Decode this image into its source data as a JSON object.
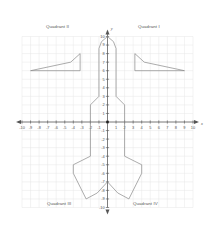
{
  "figure": {
    "title": "",
    "axis_labels": {
      "x": "x",
      "y": "y"
    },
    "quadrants": [
      {
        "id": "q1",
        "label": "Quadrant I"
      },
      {
        "id": "q2",
        "label": "Quadrant II"
      },
      {
        "id": "q3",
        "label": "Quadrant III"
      },
      {
        "id": "q4",
        "label": "Quadrant IV"
      }
    ],
    "colors": {
      "grid": "#e6e6e6",
      "axis": "#555555",
      "shape_stroke": "#888888",
      "text": "#555555",
      "background": "#ffffff"
    }
  },
  "chart_data": {
    "type": "scatter",
    "title": "",
    "xlabel": "x",
    "ylabel": "y",
    "xlim": [
      -10,
      10
    ],
    "ylim": [
      -10,
      10
    ],
    "grid": true,
    "legend": "none",
    "xticks": [
      -10,
      -9,
      -8,
      -7,
      -6,
      -5,
      -4,
      -3,
      -2,
      -1,
      1,
      2,
      3,
      4,
      5,
      6,
      7,
      8,
      9,
      10
    ],
    "xticklabels": [
      "-10",
      "-9",
      "-8",
      "-7",
      "-6",
      "-5",
      "-4",
      "-3",
      "-2",
      "-1",
      "1",
      "2",
      "3",
      "4",
      "5",
      "6",
      "7",
      "8",
      "9",
      "10"
    ],
    "yticks": [
      10,
      9,
      8,
      7,
      6,
      5,
      4,
      3,
      2,
      1,
      -1,
      -2,
      -3,
      -4,
      -5,
      -6,
      -7,
      -8,
      -9,
      -10
    ],
    "yticklabels": [
      "10",
      "9",
      "8",
      "7",
      "6",
      "5",
      "4",
      "3",
      "2",
      "1",
      "-1",
      "-2",
      "-3",
      "-4",
      "-5",
      "-6",
      "-7",
      "-8",
      "-9",
      "-10"
    ],
    "annotations": [
      "Quadrant I",
      "Quadrant II",
      "Quadrant III",
      "Quadrant IV"
    ],
    "series": [
      {
        "name": "rocket-body",
        "type": "polygon",
        "closed": true,
        "points": [
          [
            0,
            10
          ],
          [
            0.7,
            9.4
          ],
          [
            1,
            8.6
          ],
          [
            1,
            3
          ],
          [
            2,
            2
          ],
          [
            2,
            -4
          ],
          [
            4,
            -5
          ],
          [
            4,
            -6
          ],
          [
            2.5,
            -9
          ],
          [
            1.2,
            -8.3
          ],
          [
            0,
            -7
          ],
          [
            -1.2,
            -8.3
          ],
          [
            -2.5,
            -9
          ],
          [
            -4,
            -6
          ],
          [
            -4,
            -5
          ],
          [
            -2,
            -4
          ],
          [
            -2,
            2
          ],
          [
            -1,
            3
          ],
          [
            -1,
            8.6
          ],
          [
            -0.7,
            9.4
          ]
        ]
      },
      {
        "name": "left-wing",
        "type": "polyline",
        "closed": true,
        "points": [
          [
            -9,
            6
          ],
          [
            -4.3,
            7
          ],
          [
            -3.2,
            8
          ],
          [
            -3.2,
            6
          ]
        ]
      },
      {
        "name": "right-wing",
        "type": "polyline",
        "closed": true,
        "points": [
          [
            9,
            6
          ],
          [
            4.3,
            7
          ],
          [
            3.2,
            8
          ],
          [
            3.2,
            6
          ]
        ]
      }
    ]
  }
}
